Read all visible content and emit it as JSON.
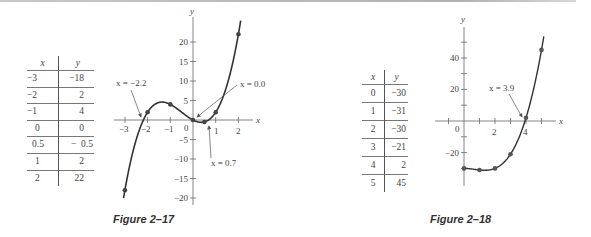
{
  "figures": [
    {
      "caption": "Figure 2–17",
      "table": {
        "headers": [
          "x",
          "y"
        ],
        "rows": [
          [
            "−3",
            "−18"
          ],
          [
            "−2",
            "2"
          ],
          [
            "−1",
            "4"
          ],
          [
            "0",
            "0"
          ],
          [
            "0.5",
            "−  0.5"
          ],
          [
            "1",
            "2"
          ],
          [
            "2",
            "22"
          ]
        ]
      },
      "annotations": [
        "x = −2.2",
        "x = 0.0",
        "x = 0.7"
      ],
      "x_ticks": [
        "−3",
        "−2",
        "−1",
        "0",
        "1",
        "2"
      ],
      "y_ticks": [
        "20",
        "15",
        "10",
        "5",
        "−5",
        "−10",
        "−15",
        "−20"
      ],
      "x_axis_label": "x",
      "y_axis_label": "y"
    },
    {
      "caption": "Figure 2–18",
      "table": {
        "headers": [
          "x",
          "y"
        ],
        "rows": [
          [
            "0",
            "−30"
          ],
          [
            "1",
            "−31"
          ],
          [
            "2",
            "−30"
          ],
          [
            "3",
            "−21"
          ],
          [
            "4",
            "2"
          ],
          [
            "5",
            "45"
          ]
        ]
      },
      "annotations": [
        "x = 3.9"
      ],
      "x_ticks": [
        "0",
        "2",
        "4"
      ],
      "y_ticks": [
        "40",
        "20",
        "−20"
      ],
      "x_axis_label": "x",
      "y_axis_label": "y"
    }
  ],
  "chart_data": [
    {
      "type": "line",
      "title": "Figure 2–17",
      "function": "y = 2x^3 + 3x^2 - 3x",
      "x": [
        -3,
        -2,
        -1,
        0,
        0.5,
        1,
        2
      ],
      "y": [
        -18,
        2,
        4,
        0,
        -0.5,
        2,
        22
      ],
      "xlabel": "x",
      "ylabel": "y",
      "xlim": [
        -3.2,
        2.6
      ],
      "ylim": [
        -21,
        25
      ],
      "x_ticks": [
        -3,
        -2,
        -1,
        0,
        1,
        2
      ],
      "y_ticks": [
        -20,
        -15,
        -10,
        -5,
        0,
        5,
        10,
        15,
        20
      ],
      "annotations": [
        {
          "text": "x = −2.2",
          "x": -2.2,
          "y": 0
        },
        {
          "text": "x = 0.0",
          "x": 0.0,
          "y": 0
        },
        {
          "text": "x = 0.7",
          "x": 0.7,
          "y": 0
        }
      ],
      "grid": false
    },
    {
      "type": "line",
      "title": "Figure 2–18",
      "function": "y = x^3 - 2x^2 - 30",
      "x": [
        0,
        1,
        2,
        3,
        4,
        5
      ],
      "y": [
        -30,
        -31,
        -30,
        -21,
        2,
        45
      ],
      "xlabel": "x",
      "ylabel": "y",
      "xlim": [
        -1.5,
        6
      ],
      "ylim": [
        -40,
        60
      ],
      "x_ticks": [
        0,
        2,
        4
      ],
      "y_ticks": [
        -20,
        20,
        40
      ],
      "annotations": [
        {
          "text": "x = 3.9",
          "x": 3.9,
          "y": 0
        }
      ],
      "grid": false
    }
  ]
}
